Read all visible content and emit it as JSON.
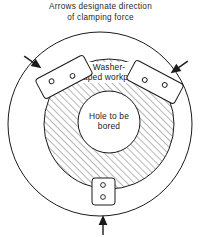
{
  "figure": {
    "caption": {
      "line1": "Arrows designate direction",
      "line2": "of clamping force"
    },
    "labels": {
      "workpiece_line1": "Washer-",
      "workpiece_line2": "shaped workpiece",
      "hole_line1": "Hole to be",
      "hole_line2": "bored"
    },
    "icons": {
      "arrow_top_left": "arrow-icon",
      "arrow_top_right": "arrow-icon",
      "arrow_bottom": "arrow-icon",
      "clamp_left": "clamp-jaw-icon",
      "clamp_right": "clamp-jaw-icon",
      "clamp_bottom": "clamp-jaw-icon",
      "bolt_hole": "bolt-hole-icon"
    },
    "colors": {
      "line": "#1a1a1a",
      "hatch": "#555555",
      "background": "#ffffff",
      "fill_white": "#ffffff"
    },
    "geometry": {
      "outer_circle": {
        "cx": 100,
        "cy": 124,
        "r": 92
      },
      "workpiece_annulus": {
        "cx": 109,
        "cy": 124,
        "r": 65
      },
      "bored_hole": {
        "cx": 109,
        "cy": 122,
        "r": 31
      },
      "hatch_angle_deg": 45,
      "clamp_count": 3,
      "bolt_holes_per_clamp": 2
    }
  }
}
